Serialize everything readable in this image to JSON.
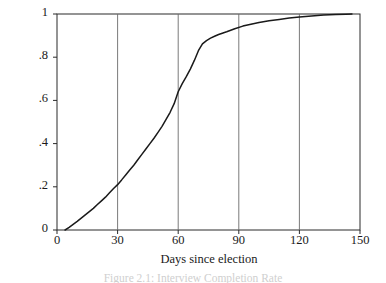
{
  "figure": {
    "background": "#ffffff",
    "ink_color": "#1a1a1a",
    "grid_color": "#6b6b6b",
    "caption_text": "Figure 2.1: Interview Completion Rate"
  },
  "chart_data": {
    "type": "line",
    "title": "",
    "subtitle": "",
    "xlabel": "Days since election",
    "ylabel": "% Proportion of interviews completed",
    "xlim": [
      0,
      150
    ],
    "ylim": [
      0,
      1
    ],
    "xticks": [
      0,
      30,
      60,
      90,
      120,
      150
    ],
    "xtick_labels": [
      "0",
      "30",
      "60",
      "90",
      "120",
      "150"
    ],
    "yticks": [
      0,
      0.2,
      0.4,
      0.6,
      0.8,
      1
    ],
    "ytick_labels": [
      "0",
      ".2",
      ".4",
      ".6",
      ".8",
      "1"
    ],
    "grid": "vertical-only",
    "gridlines_x": [
      30,
      60,
      90,
      120
    ],
    "legend": "none",
    "legend_position": "none",
    "annotations": [],
    "series": [
      {
        "name": "Cumulative proportion of interviews completed",
        "line_color": "#1a1a1a",
        "line_width": 1.5,
        "x": [
          4,
          6,
          8,
          10,
          12,
          14,
          16,
          18,
          20,
          22,
          24,
          26,
          28,
          30,
          32,
          34,
          36,
          38,
          40,
          42,
          44,
          46,
          48,
          50,
          52,
          54,
          56,
          58,
          60,
          62,
          64,
          66,
          68,
          70,
          72,
          74,
          76,
          78,
          80,
          84,
          88,
          92,
          96,
          100,
          105,
          110,
          115,
          120,
          126,
          132,
          138,
          143,
          146
        ],
        "y": [
          0.0,
          0.012,
          0.026,
          0.04,
          0.055,
          0.07,
          0.085,
          0.1,
          0.118,
          0.135,
          0.152,
          0.172,
          0.192,
          0.21,
          0.232,
          0.255,
          0.278,
          0.3,
          0.325,
          0.35,
          0.375,
          0.4,
          0.425,
          0.452,
          0.48,
          0.512,
          0.545,
          0.585,
          0.64,
          0.678,
          0.71,
          0.745,
          0.785,
          0.83,
          0.862,
          0.877,
          0.888,
          0.897,
          0.905,
          0.918,
          0.932,
          0.944,
          0.953,
          0.961,
          0.969,
          0.975,
          0.981,
          0.986,
          0.991,
          0.995,
          0.998,
          0.999,
          1.0
        ]
      }
    ]
  }
}
